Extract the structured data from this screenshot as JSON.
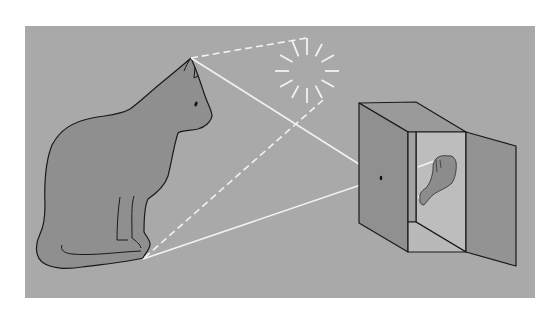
{
  "figure": {
    "colors": {
      "page": "#ffffff",
      "panel": "#a9a9a9",
      "cat_fill": "#8f8f8f",
      "outline": "#1a1a1a",
      "box_side": "#909090",
      "box_top": "#9a9a9a",
      "box_inner_back": "#bdbdbd",
      "box_inner_left": "#a3a3a3",
      "box_inner_floor": "#b9b9b9",
      "door": "#939393",
      "ray": "#f2f2f2",
      "image_fill": "#8c8c8c"
    },
    "elements": {
      "object": "cat",
      "light_source": "sun",
      "camera": "box with pinhole",
      "projected_image": "inverted cat"
    }
  }
}
